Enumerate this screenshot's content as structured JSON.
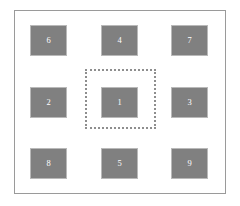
{
  "diagram": {
    "background_color": "#ffffff",
    "frame": {
      "border_color": "#9a9a9a"
    },
    "selection": {
      "name": "dotted-selection-region",
      "border_style": "dotted",
      "border_color": "#8e8e8e",
      "encloses_box_label": "1"
    },
    "box_style": {
      "fill_color": "#808080",
      "border_color": "#b9b9b9",
      "label_color": "#ffffff"
    },
    "grid": {
      "rows": 3,
      "columns": 3,
      "cells": [
        {
          "label": "6",
          "row": "top",
          "column": "left"
        },
        {
          "label": "4",
          "row": "top",
          "column": "center"
        },
        {
          "label": "7",
          "row": "top",
          "column": "right"
        },
        {
          "label": "2",
          "row": "middle",
          "column": "left"
        },
        {
          "label": "1",
          "row": "middle",
          "column": "center"
        },
        {
          "label": "3",
          "row": "middle",
          "column": "right"
        },
        {
          "label": "8",
          "row": "bottom",
          "column": "left"
        },
        {
          "label": "5",
          "row": "bottom",
          "column": "center"
        },
        {
          "label": "9",
          "row": "bottom",
          "column": "right"
        }
      ]
    }
  }
}
